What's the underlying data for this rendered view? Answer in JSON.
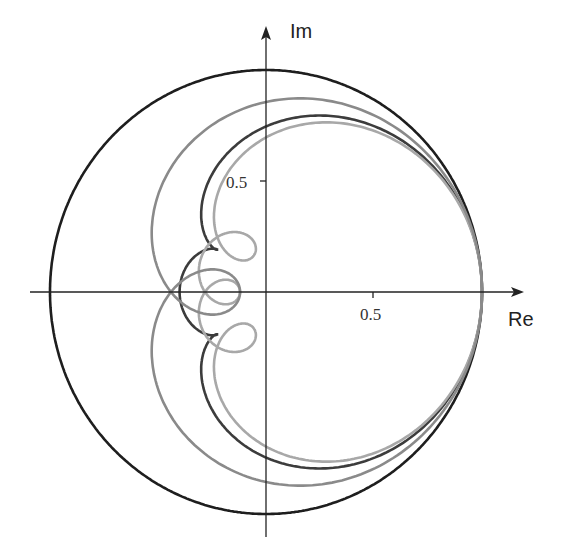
{
  "chart_data": {
    "type": "line",
    "title": "",
    "xlabel": "Re",
    "ylabel": "Im",
    "x_ticks": [
      {
        "value": 0.5,
        "label": "0.5"
      }
    ],
    "y_ticks": [
      {
        "value": 0.5,
        "label": "0.5"
      }
    ],
    "xlim": [
      -1.1,
      1.2
    ],
    "ylim": [
      -1.1,
      1.2
    ],
    "grid": false,
    "legend": null,
    "series": [
      {
        "name": "unit-circle",
        "color": "#1e1e1e",
        "kind": "circle",
        "center": [
          0,
          0
        ],
        "radius": 1.0
      },
      {
        "name": "dark-curve",
        "color": "#3c3c3c",
        "kind": "fourier",
        "coefficients": [
          [
            1,
            0.52
          ],
          [
            2,
            0.3
          ],
          [
            3,
            0.18
          ]
        ]
      },
      {
        "name": "light-gray-curve",
        "color": "#a8a8a8",
        "kind": "fourier",
        "coefficients": [
          [
            1,
            0.36
          ],
          [
            2,
            0.25
          ],
          [
            3,
            0.2
          ],
          [
            4,
            0.19
          ]
        ]
      },
      {
        "name": "medium-gray-curve",
        "color": "#8a8a8a",
        "kind": "fourier",
        "coefficients": [
          [
            2,
            0.56
          ],
          [
            4,
            0.44
          ]
        ]
      }
    ]
  },
  "axes": {
    "x_label": "Re",
    "y_label": "Im",
    "x_tick_label": "0.5",
    "y_tick_label": "0.5"
  }
}
